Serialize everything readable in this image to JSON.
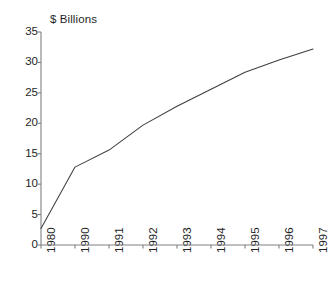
{
  "chart_data": {
    "type": "line",
    "title": "$ Billions",
    "xlabel": "",
    "ylabel": "",
    "categories": [
      "1980",
      "1990",
      "1991",
      "1992",
      "1993",
      "1994",
      "1995",
      "1996",
      "1997"
    ],
    "values": [
      2.7,
      12.8,
      15.6,
      19.7,
      22.8,
      25.6,
      28.4,
      30.4,
      32.2
    ],
    "series": [
      {
        "name": "$ Billions",
        "values": [
          2.7,
          12.8,
          15.6,
          19.7,
          22.8,
          25.6,
          28.4,
          30.4,
          32.2
        ]
      }
    ],
    "ylim": [
      0,
      35
    ],
    "y_ticks": [
      0,
      5,
      10,
      15,
      20,
      25,
      30,
      35
    ],
    "y_tick_labels": [
      "0",
      "5",
      "10",
      "15",
      "20",
      "25",
      "30",
      "35"
    ],
    "x_tick_labels": [
      "1980",
      "1990",
      "1991",
      "1992",
      "1993",
      "1994",
      "1995",
      "1996",
      "1997"
    ],
    "x_tick_rotation": 90,
    "grid": false,
    "legend": false,
    "legend_position": "none",
    "markers": false,
    "line_color": "#3f3f3f",
    "axis_color": "#808080",
    "background_color": "#ffffff",
    "text_color": "#1f1f1f"
  }
}
